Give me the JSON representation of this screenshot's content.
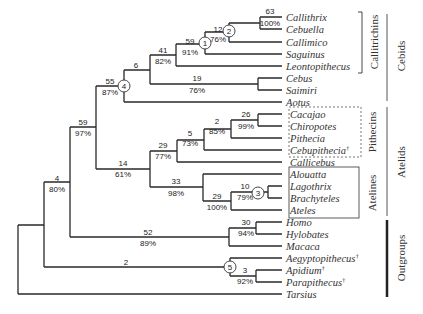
{
  "diagram": {
    "type": "phylogenetic-tree",
    "leaves": [
      {
        "name": "Callithrix",
        "y": 17,
        "dagger": false
      },
      {
        "name": "Cebuella",
        "y": 29,
        "dagger": false
      },
      {
        "name": "Callimico",
        "y": 42,
        "dagger": false
      },
      {
        "name": "Saguinus",
        "y": 54,
        "dagger": false
      },
      {
        "name": "Leontopithecus",
        "y": 66,
        "dagger": false
      },
      {
        "name": "Cebus",
        "y": 78,
        "dagger": false
      },
      {
        "name": "Saimiri",
        "y": 90,
        "dagger": false
      },
      {
        "name": "Aotus",
        "y": 102,
        "dagger": false
      },
      {
        "name": "Cacajao",
        "y": 114,
        "dagger": false
      },
      {
        "name": "Chiropotes",
        "y": 126,
        "dagger": false
      },
      {
        "name": "Pithecia",
        "y": 138,
        "dagger": false
      },
      {
        "name": "Cebupithecia",
        "y": 150,
        "dagger": true
      },
      {
        "name": "Callicebus",
        "y": 162,
        "dagger": false
      },
      {
        "name": "Alouatta",
        "y": 174,
        "dagger": false
      },
      {
        "name": "Lagothrix",
        "y": 186,
        "dagger": false
      },
      {
        "name": "Brachyteles",
        "y": 198,
        "dagger": false
      },
      {
        "name": "Ateles",
        "y": 210,
        "dagger": false
      },
      {
        "name": "Homo",
        "y": 222,
        "dagger": false
      },
      {
        "name": "Hylobates",
        "y": 234,
        "dagger": false
      },
      {
        "name": "Macaca",
        "y": 246,
        "dagger": false
      },
      {
        "name": "Aegyptopithecus",
        "y": 258,
        "dagger": true
      },
      {
        "name": "Apidium",
        "y": 270,
        "dagger": true
      },
      {
        "name": "Parapithecus",
        "y": 282,
        "dagger": true
      },
      {
        "name": "Tarsius",
        "y": 294,
        "dagger": false
      }
    ],
    "dagger_symbol": "†",
    "support_labels": [
      {
        "id": "n-callithrix-cebuella",
        "above": "63",
        "below": "100%",
        "x": 240,
        "y": 23
      },
      {
        "id": "n-2",
        "above": "12",
        "below": "76%",
        "x": 221,
        "y": 35
      },
      {
        "id": "n-1",
        "above": "59",
        "below": "91%",
        "x": 190,
        "y": 47
      },
      {
        "id": "n-callitrichins",
        "above": "41",
        "below": "82%",
        "x": 163,
        "y": 56
      },
      {
        "id": "n-cebus-saimiri",
        "above": "19",
        "below": "76%",
        "x": 196,
        "y": 84
      },
      {
        "id": "n-6",
        "above": "6",
        "below": "",
        "x": 136,
        "y": 70
      },
      {
        "id": "n-4",
        "above": "55",
        "below": "87%",
        "x": 110,
        "y": 86
      },
      {
        "id": "n-cacajao-chiropotes",
        "above": "26",
        "below": "99%",
        "x": 245,
        "y": 120
      },
      {
        "id": "n-pithecia",
        "above": "2",
        "below": "85%",
        "x": 216,
        "y": 126
      },
      {
        "id": "n-cebupithecia",
        "above": "5",
        "below": "73%",
        "x": 190,
        "y": 138
      },
      {
        "id": "n-pithecins",
        "above": "29",
        "below": "77%",
        "x": 163,
        "y": 150
      },
      {
        "id": "n-atelids",
        "above": "14",
        "below": "61%",
        "x": 123,
        "y": 168
      },
      {
        "id": "n-lagothrix",
        "above": "10",
        "below": "79%",
        "x": 245,
        "y": 192
      },
      {
        "id": "n-ateles",
        "above": "29",
        "below": "100%",
        "x": 216,
        "y": 204
      },
      {
        "id": "n-atelines",
        "above": "33",
        "below": "98%",
        "x": 176,
        "y": 186
      },
      {
        "id": "n-platyrrhini",
        "above": "59",
        "below": "97%",
        "x": 83,
        "y": 128
      },
      {
        "id": "n-homo-hylobates",
        "above": "30",
        "below": "94%",
        "x": 245,
        "y": 228
      },
      {
        "id": "n-catarrhini",
        "above": "52",
        "below": "89%",
        "x": 148,
        "y": 236
      },
      {
        "id": "n-anthropoidea",
        "above": "4",
        "below": "80%",
        "x": 57,
        "y": 184
      },
      {
        "id": "n-apidium-parapithecus",
        "above": "3",
        "below": "92%",
        "x": 244,
        "y": 276
      },
      {
        "id": "n-fossil",
        "above": "2",
        "below": "",
        "x": 125,
        "y": 266
      }
    ],
    "circled_nodes": [
      {
        "label": "1",
        "x": 205,
        "y": 43
      },
      {
        "label": "2",
        "x": 229,
        "y": 31
      },
      {
        "label": "3",
        "x": 261,
        "y": 193
      },
      {
        "label": "4",
        "x": 124,
        "y": 85
      },
      {
        "label": "5",
        "x": 230,
        "y": 268
      }
    ],
    "group_boxes": {
      "callitrichins": {
        "label": "Callitrichins",
        "style": "bracket"
      },
      "pithecins": {
        "label": "Pithecins",
        "style": "dashed-box"
      },
      "atelines": {
        "label": "Atelines",
        "style": "solid-box"
      }
    },
    "side_groups": [
      {
        "label": "Cebids",
        "weight": "thin"
      },
      {
        "label": "Atelids",
        "weight": "thin"
      },
      {
        "label": "Outgroups",
        "weight": "thick"
      }
    ]
  }
}
